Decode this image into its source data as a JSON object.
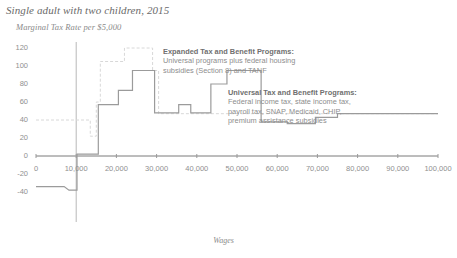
{
  "header": {
    "title": "Single adult with two children, 2015",
    "subtitle": "Marginal Tax Rate per $5,000"
  },
  "annotations": {
    "expanded": {
      "heading": "Expanded Tax and Benefit Programs:",
      "line1": "Universal programs plus federal housing",
      "line2": "subsidies (Section 8) and TANF"
    },
    "universal": {
      "heading": "Universal Tax and Benefit Programs:",
      "line1": "Federal income tax, state income tax,",
      "line2": "payroll tax, SNAP, Medicaid, CHIP,",
      "line3": "premium assistance subsidies"
    }
  },
  "chart_data": {
    "type": "line",
    "title": "Single adult with two children, 2015",
    "subtitle": "Marginal Tax Rate per $5,000",
    "xlabel": "Wages",
    "ylabel": "",
    "xlim": [
      0,
      100000
    ],
    "ylim": [
      -40,
      120
    ],
    "grid": false,
    "legend_position": "annotations-inline",
    "xticks": [
      0,
      10000,
      20000,
      30000,
      40000,
      50000,
      60000,
      70000,
      80000,
      90000,
      100000
    ],
    "xticklabels": [
      "0",
      "10,000",
      "20,000",
      "30,000",
      "40,000",
      "50,000",
      "60,000",
      "70,000",
      "80,000",
      "90,000",
      "100,000"
    ],
    "yticks": [
      -40,
      -20,
      0,
      20,
      40,
      60,
      80,
      100,
      120
    ],
    "yticklabels": [
      "-40",
      "-20",
      "0",
      "20",
      "40",
      "60",
      "80",
      "100",
      "120"
    ],
    "series": [
      {
        "name": "Expanded Tax and Benefit Programs",
        "style": "dashed",
        "color": "#d8d8d8",
        "x": [
          0,
          8000,
          8000,
          13500,
          13500,
          15000,
          15000,
          16000,
          16000,
          22000,
          22000,
          29000,
          29000,
          30500,
          30500,
          100000
        ],
        "y": [
          40,
          40,
          40,
          40,
          22,
          22,
          60,
          60,
          105,
          105,
          120,
          120,
          95,
          95,
          47,
          47
        ]
      },
      {
        "name": "Universal Tax and Benefit Programs",
        "style": "solid",
        "color": "#9b9b9b",
        "x": [
          0,
          7000,
          8200,
          10200,
          10200,
          11200,
          11200,
          15500,
          15500,
          20500,
          20500,
          24000,
          24000,
          29500,
          29500,
          35500,
          35500,
          38500,
          38500,
          43500,
          43500,
          47500,
          47500,
          52000,
          52000,
          56000,
          56000,
          62500,
          62500,
          69500,
          69500,
          75000,
          75000,
          100000
        ],
        "y": [
          -34,
          -34,
          -38,
          -38,
          2,
          2,
          2,
          2,
          57,
          57,
          73,
          73,
          95,
          95,
          48,
          48,
          57,
          57,
          48,
          48,
          80,
          80,
          95,
          95,
          95,
          95,
          38,
          38,
          36,
          36,
          43,
          43,
          47,
          47
        ]
      }
    ]
  }
}
